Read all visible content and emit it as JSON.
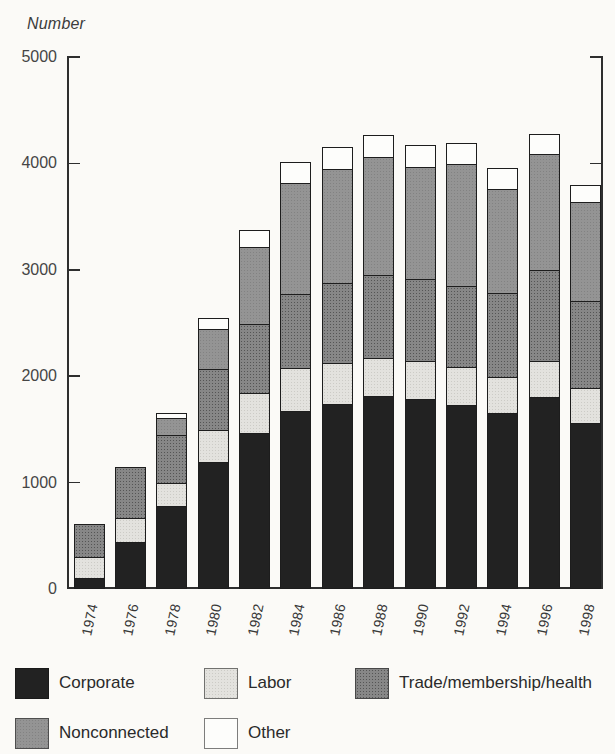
{
  "title": "Number",
  "y_axis": {
    "label": "Number",
    "tick_labels": [
      "5000",
      "4000",
      "3000",
      "2000",
      "1000",
      "0"
    ],
    "min": 0,
    "max": 5000,
    "step": 1000
  },
  "x_axis": {
    "categories": [
      "1974",
      "1976",
      "1978",
      "1980",
      "1982",
      "1984",
      "1986",
      "1988",
      "1990",
      "1992",
      "1994",
      "1996",
      "1998"
    ]
  },
  "legend": {
    "row1": [
      "Corporate",
      "Labor",
      "Trade/membership/health"
    ],
    "row2": [
      "Nonconnected",
      "Other"
    ]
  },
  "colors": {
    "corporate": "#222222",
    "labor": "#e3e2de",
    "trade_membership_health": "#878787",
    "nonconnected": "#949494",
    "other": "#fdfdfb",
    "axis": "#2e2e2e",
    "background": "#fbfaf7"
  },
  "chart_data": {
    "type": "bar",
    "stacked": true,
    "title": "Number",
    "ylabel": "Number",
    "ylim": [
      0,
      5000
    ],
    "grid": false,
    "legend_position": "bottom",
    "categories": [
      "1974",
      "1976",
      "1978",
      "1980",
      "1982",
      "1984",
      "1986",
      "1988",
      "1990",
      "1992",
      "1994",
      "1996",
      "1998"
    ],
    "series": [
      {
        "name": "Corporate",
        "color": "#222222",
        "values": [
          89,
          433,
          785,
          1206,
          1469,
          1682,
          1744,
          1816,
          1795,
          1735,
          1660,
          1810,
          1567
        ]
      },
      {
        "name": "Labor",
        "color": "#e3e2de",
        "values": [
          201,
          224,
          217,
          297,
          380,
          394,
          384,
          354,
          346,
          347,
          333,
          330,
          321
        ]
      },
      {
        "name": "Trade/membership/health",
        "color": "#878787",
        "values": [
          318,
          489,
          453,
          576,
          649,
          698,
          745,
          786,
          774,
          770,
          792,
          860,
          821
        ]
      },
      {
        "name": "Nonconnected",
        "color": "#949494",
        "values": [
          0,
          0,
          162,
          374,
          723,
          1053,
          1077,
          1115,
          1062,
          1145,
          980,
          1095,
          935
        ]
      },
      {
        "name": "Other",
        "color": "#fdfdfb",
        "values": [
          0,
          0,
          36,
          98,
          150,
          182,
          207,
          197,
          195,
          198,
          189,
          185,
          154
        ]
      }
    ],
    "totals": [
      608,
      1146,
      1653,
      2551,
      3371,
      4009,
      4157,
      4268,
      4172,
      4195,
      3954,
      4280,
      3798
    ]
  }
}
